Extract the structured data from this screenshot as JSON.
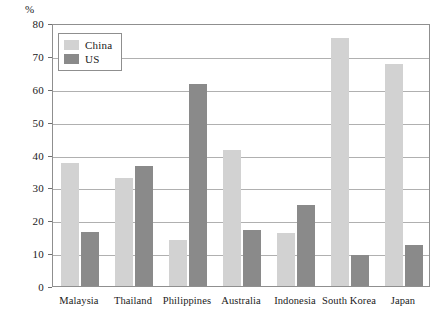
{
  "chart_data": {
    "type": "bar",
    "title": "",
    "xlabel": "",
    "ylabel": "%",
    "ylim": [
      0,
      80
    ],
    "ytick_step": 10,
    "yticks": [
      0,
      10,
      20,
      30,
      40,
      50,
      60,
      70,
      80
    ],
    "ytick_labels": [
      "0",
      "10",
      "20",
      "30",
      "40",
      "50",
      "60",
      "70",
      "80"
    ],
    "grid": true,
    "legend_position": "top-left-inside",
    "categories": [
      "Malaysia",
      "Thailand",
      "Philippines",
      "Australia",
      "Indonesia",
      "South Korea",
      "Japan"
    ],
    "series": [
      {
        "name": "China",
        "color": "#d2d2d2",
        "values": [
          37.5,
          33.0,
          14.0,
          41.5,
          16.0,
          75.5,
          67.5
        ]
      },
      {
        "name": "US",
        "color": "#8a8a8a",
        "values": [
          16.5,
          36.5,
          61.5,
          17.0,
          24.5,
          9.5,
          12.5
        ]
      }
    ]
  },
  "legend": {
    "entries": [
      {
        "label": "China",
        "swatch": "china"
      },
      {
        "label": "US",
        "swatch": "us"
      }
    ]
  },
  "colors": {
    "china_bar": "#d2d2d2",
    "us_bar": "#8a8a8a",
    "gridline": "#b0b0b0",
    "frame": "#8f8f8f",
    "text": "#1a1a1a",
    "background": "#ffffff"
  }
}
